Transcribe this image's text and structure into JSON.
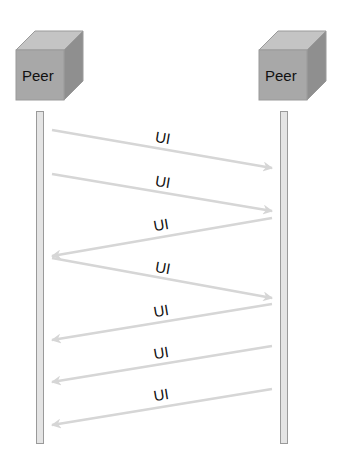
{
  "peers": [
    {
      "label": "Peer",
      "side": "left"
    },
    {
      "label": "Peer",
      "side": "right"
    }
  ],
  "colors": {
    "cube_front": "#a8a8a8",
    "cube_top": "#c4c4c4",
    "cube_side": "#8f8f8f",
    "arrow": "#d6d6d6",
    "lifeline": "#e4e4e4"
  },
  "messages": [
    {
      "label": "UI",
      "direction": "right",
      "x1": 52,
      "y1": 130,
      "x2": 272,
      "y2": 168,
      "lx": 162,
      "ly": 143
    },
    {
      "label": "UI",
      "direction": "right",
      "x1": 52,
      "y1": 174,
      "x2": 272,
      "y2": 211,
      "lx": 162,
      "ly": 187
    },
    {
      "label": "UI",
      "direction": "left",
      "x1": 272,
      "y1": 218,
      "x2": 52,
      "y2": 256,
      "lx": 162,
      "ly": 230
    },
    {
      "label": "UI",
      "direction": "right",
      "x1": 52,
      "y1": 258,
      "x2": 272,
      "y2": 298,
      "lx": 162,
      "ly": 273
    },
    {
      "label": "UI",
      "direction": "left",
      "x1": 272,
      "y1": 304,
      "x2": 52,
      "y2": 340,
      "lx": 162,
      "ly": 316
    },
    {
      "label": "UI",
      "direction": "left",
      "x1": 272,
      "y1": 346,
      "x2": 52,
      "y2": 382,
      "lx": 162,
      "ly": 358
    },
    {
      "label": "UI",
      "direction": "left",
      "x1": 272,
      "y1": 389,
      "x2": 52,
      "y2": 425,
      "lx": 162,
      "ly": 400
    }
  ]
}
